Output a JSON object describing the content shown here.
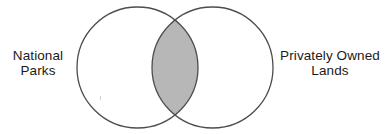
{
  "figure": {
    "type": "venn-diagram",
    "title": "",
    "background_color": "#ffffff",
    "width": 392,
    "height": 134
  },
  "sets": {
    "left": {
      "name": "National Parks",
      "label_lines": [
        "National",
        "Parks"
      ],
      "fill_color": "#ffffff",
      "stroke_color": "#4d4d4d",
      "center_x": 137.5,
      "center_y": 67.5,
      "radius": 60.5
    },
    "right": {
      "name": "Privately Owned Lands",
      "label_lines": [
        "Privately Owned",
        "Lands"
      ],
      "fill_color": "#ffffff",
      "stroke_color": "#4d4d4d",
      "center_x": 212.5,
      "center_y": 67.5,
      "radius": 60.5
    }
  },
  "intersection": {
    "name": "overlap-region",
    "label": "",
    "fill_color": "#b7b7b7",
    "shape": "lens",
    "left_x": 152,
    "right_x": 198,
    "top_y": 23,
    "bottom_y": 112
  },
  "artifact": {
    "name": "scan-speck"
  }
}
